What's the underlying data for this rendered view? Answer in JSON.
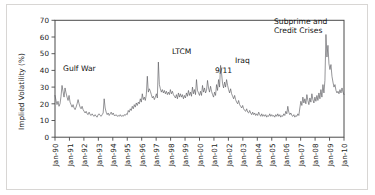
{
  "chart_data": {
    "type": "line",
    "title": "",
    "xlabel": "",
    "ylabel": "Implied Volatility (%)",
    "ylim": [
      0,
      70
    ],
    "yticks": [
      0,
      10,
      20,
      30,
      40,
      50,
      60,
      70
    ],
    "xlim": [
      "Jan-90",
      "Jan-10"
    ],
    "grid": false,
    "legend": "none",
    "xticks": [
      "Jan-90",
      "Jan-91",
      "Jan-92",
      "Jan-93",
      "Jan-94",
      "Jan-95",
      "Jan-96",
      "Jan-97",
      "Jan-98",
      "Jan-99",
      "Jan-00",
      "Jan-01",
      "Jan-02",
      "Jan-03",
      "Jan-04",
      "Jan-05",
      "Jan-06",
      "Jan-07",
      "Jan-08",
      "Jan-09",
      "Jan-10"
    ],
    "series": [
      {
        "name": "Implied Volatility",
        "color": "#54545a",
        "x_start_year": 1990.0,
        "x_step_years": 0.08333,
        "values": [
          25.0,
          22.0,
          19.5,
          21.5,
          18.5,
          20.0,
          24.5,
          31.0,
          27.5,
          24.0,
          29.5,
          26.5,
          24.0,
          22.0,
          25.0,
          21.0,
          19.5,
          18.0,
          19.5,
          17.5,
          16.5,
          18.0,
          20.0,
          22.5,
          20.0,
          18.0,
          17.0,
          18.5,
          16.5,
          15.5,
          14.5,
          15.5,
          14.0,
          13.5,
          15.0,
          13.5,
          13.0,
          14.0,
          13.0,
          12.5,
          13.5,
          12.5,
          12.0,
          13.5,
          14.0,
          13.0,
          12.5,
          13.5,
          14.5,
          23.0,
          17.5,
          15.0,
          13.5,
          14.5,
          13.0,
          14.0,
          15.0,
          13.5,
          14.5,
          13.0,
          13.0,
          13.5,
          12.5,
          13.0,
          12.5,
          13.5,
          12.5,
          13.0,
          12.5,
          13.5,
          13.0,
          14.0,
          13.5,
          16.0,
          15.0,
          17.0,
          16.0,
          18.5,
          17.0,
          19.5,
          18.0,
          20.5,
          19.0,
          21.0,
          20.0,
          23.0,
          21.0,
          26.0,
          22.5,
          24.0,
          22.0,
          25.5,
          36.5,
          27.0,
          29.0,
          27.5,
          25.5,
          23.5,
          24.5,
          22.5,
          24.0,
          26.0,
          23.5,
          45.0,
          31.5,
          29.0,
          27.0,
          28.5,
          26.5,
          28.0,
          26.0,
          27.5,
          25.5,
          27.0,
          25.5,
          28.5,
          26.0,
          27.5,
          25.5,
          24.5,
          23.5,
          25.5,
          23.0,
          26.5,
          24.0,
          26.0,
          24.0,
          25.5,
          23.0,
          25.0,
          23.5,
          26.5,
          24.5,
          28.0,
          25.0,
          27.0,
          24.5,
          30.0,
          26.0,
          28.5,
          25.5,
          34.5,
          28.0,
          26.5,
          25.0,
          27.5,
          25.0,
          31.0,
          27.0,
          29.5,
          26.5,
          28.0,
          34.0,
          29.5,
          27.0,
          30.5,
          27.5,
          25.5,
          24.0,
          27.0,
          25.0,
          31.5,
          28.0,
          34.5,
          30.0,
          43.0,
          38.0,
          32.0,
          29.5,
          33.0,
          30.0,
          34.5,
          31.0,
          28.5,
          26.5,
          29.0,
          26.0,
          24.5,
          23.0,
          25.0,
          22.5,
          21.0,
          20.0,
          22.0,
          19.5,
          18.5,
          17.5,
          19.0,
          17.0,
          16.0,
          15.5,
          17.0,
          15.0,
          14.5,
          16.0,
          14.5,
          13.5,
          15.0,
          13.5,
          14.5,
          13.0,
          14.0,
          13.0,
          15.0,
          13.5,
          12.5,
          14.0,
          12.5,
          13.5,
          12.5,
          13.5,
          12.0,
          13.0,
          12.5,
          14.0,
          12.5,
          13.5,
          12.5,
          13.0,
          12.0,
          13.5,
          12.5,
          14.0,
          12.5,
          13.5,
          12.0,
          13.0,
          12.5,
          14.0,
          13.0,
          15.5,
          14.0,
          18.5,
          15.0,
          13.5,
          14.5,
          13.0,
          12.5,
          13.5,
          12.0,
          13.0,
          12.5,
          14.0,
          13.0,
          17.5,
          21.5,
          19.0,
          24.0,
          20.5,
          23.0,
          20.0,
          25.5,
          22.0,
          19.5,
          23.5,
          21.0,
          26.0,
          22.5,
          20.5,
          24.0,
          21.5,
          25.0,
          22.0,
          26.5,
          23.0,
          28.5,
          24.0,
          31.5,
          26.5,
          34.0,
          61.5,
          48.0,
          55.0,
          44.0,
          40.5,
          43.5,
          36.5,
          33.0,
          30.0,
          31.5,
          28.0,
          26.5,
          27.5,
          26.0,
          28.5,
          26.5,
          29.5,
          27.0,
          25.5
        ]
      }
    ],
    "annotations": [
      {
        "id": "gulf-war",
        "text": "Gulf War",
        "x_px": 63,
        "y_px": 71
      },
      {
        "id": "ltcm",
        "text": "LTCM",
        "x_px": 172,
        "y_px": 54
      },
      {
        "id": "nine-eleven",
        "text": "9/11",
        "x_px": 215,
        "y_px": 73
      },
      {
        "id": "iraq",
        "text": "Iraq",
        "x_px": 235,
        "y_px": 63
      },
      {
        "id": "subprime-credit-crises-line1",
        "text": "Subprime and",
        "x_px": 274,
        "y_px": 24
      },
      {
        "id": "subprime-credit-crises-line2",
        "text": "Credit Crises",
        "x_px": 274,
        "y_px": 33
      }
    ]
  }
}
